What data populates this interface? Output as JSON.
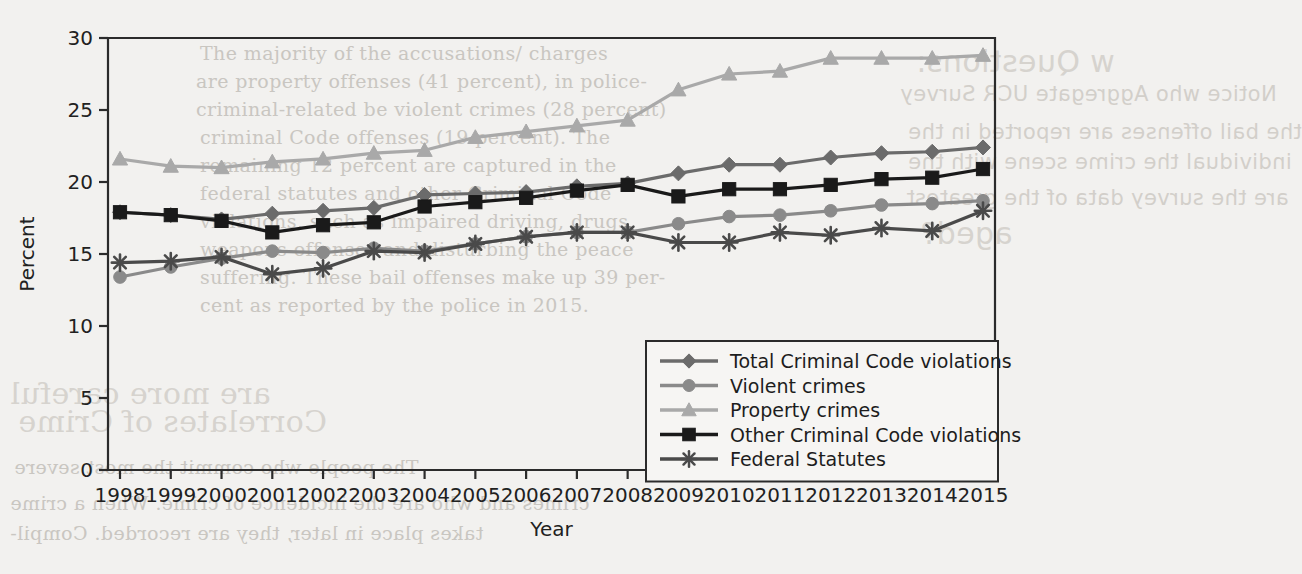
{
  "chart_data": {
    "type": "line",
    "title": "",
    "xlabel": "Year",
    "ylabel": "Percent",
    "ylim": [
      0,
      30
    ],
    "yticks": [
      0,
      5,
      10,
      15,
      20,
      25,
      30
    ],
    "grid": false,
    "legend_position": "bottom-right",
    "categories": [
      "1998",
      "1999",
      "2000",
      "2001",
      "2002",
      "2003",
      "2004",
      "2005",
      "2006",
      "2007",
      "2008",
      "2009",
      "2010",
      "2011",
      "2012",
      "2013",
      "2014",
      "2015"
    ],
    "x": [
      1998,
      1999,
      2000,
      2001,
      2002,
      2003,
      2004,
      2005,
      2006,
      2007,
      2008,
      2009,
      2010,
      2011,
      2012,
      2013,
      2014,
      2015
    ],
    "series": [
      {
        "name": "Total Criminal Code violations",
        "marker": "diamond",
        "color": "#6b6b6b",
        "values": [
          17.9,
          17.7,
          17.4,
          17.8,
          18.0,
          18.2,
          19.1,
          19.2,
          19.3,
          19.7,
          19.9,
          20.6,
          21.2,
          21.2,
          21.7,
          22.0,
          22.1,
          22.4
        ]
      },
      {
        "name": "Violent crimes",
        "marker": "circle",
        "color": "#8a8a8a",
        "values": [
          13.4,
          14.1,
          14.7,
          15.2,
          15.1,
          15.4,
          15.2,
          15.7,
          16.2,
          16.5,
          16.5,
          17.1,
          17.6,
          17.7,
          18.0,
          18.4,
          18.5,
          18.7
        ]
      },
      {
        "name": "Property crimes",
        "marker": "triangle",
        "color": "#a9a9a9",
        "values": [
          21.6,
          21.1,
          21.0,
          21.4,
          21.6,
          22.0,
          22.2,
          23.1,
          23.5,
          23.9,
          24.3,
          26.4,
          27.5,
          27.7,
          28.6,
          28.6,
          28.6,
          28.8
        ]
      },
      {
        "name": "Other Criminal Code violations",
        "marker": "square",
        "color": "#1a1a1a",
        "values": [
          17.9,
          17.7,
          17.3,
          16.5,
          17.0,
          17.2,
          18.3,
          18.6,
          18.9,
          19.4,
          19.8,
          19.0,
          19.5,
          19.5,
          19.8,
          20.2,
          20.3,
          20.9
        ]
      },
      {
        "name": "Federal Statutes",
        "marker": "asterisk",
        "color": "#4a4a4a",
        "values": [
          14.4,
          14.5,
          14.8,
          13.6,
          14.0,
          15.2,
          15.1,
          15.7,
          16.2,
          16.5,
          16.5,
          15.8,
          15.8,
          16.5,
          16.3,
          16.8,
          16.6,
          18.0
        ]
      }
    ]
  },
  "background_text": [
    {
      "text": "The majority of the accusations/ charges",
      "x": 200,
      "y": 42
    },
    {
      "text": "are property offenses (41 percent), in police-",
      "x": 196,
      "y": 70
    },
    {
      "text": "criminal-related be violent crimes (28 percent)",
      "x": 196,
      "y": 98
    },
    {
      "text": "criminal Code offenses (19 percent). The",
      "x": 200,
      "y": 126
    },
    {
      "text": "remaining 12 percent are captured in the",
      "x": 200,
      "y": 154
    },
    {
      "text": "federal statutes and other Criminal Code",
      "x": 200,
      "y": 182
    },
    {
      "text": "violations, such as impaired driving, drugs,",
      "x": 200,
      "y": 210
    },
    {
      "text": "weapons offenses and disturbing the peace",
      "x": 200,
      "y": 238
    },
    {
      "text": "suffering. These bail offenses make up 39 per-",
      "x": 200,
      "y": 266
    },
    {
      "text": "cent as reported by the police in 2015.",
      "x": 200,
      "y": 294
    },
    {
      "text": "w Questions:",
      "x": 916,
      "y": 44
    },
    {
      "text": "Notice who Aggregate UCR Survey",
      "x": 900,
      "y": 82
    },
    {
      "text": "the bail offenses are reported in the",
      "x": 908,
      "y": 120
    },
    {
      "text": "individual the crime scene with the",
      "x": 908,
      "y": 150
    },
    {
      "text": "are the survey data of the greatest",
      "x": 906,
      "y": 186
    },
    {
      "text": "aged?",
      "x": 920,
      "y": 216
    },
    {
      "text": "Correlates of Crime",
      "x": 18,
      "y": 404
    },
    {
      "text": "The people who commit the most severe",
      "x": 14,
      "y": 456
    },
    {
      "text": "crimes and who are the incidence of crime. When a crime",
      "x": 10,
      "y": 492
    },
    {
      "text": "takes place in later, they are recorded. Compil-",
      "x": 10,
      "y": 522
    },
    {
      "text": "are more careful",
      "x": 10,
      "y": 376
    }
  ]
}
